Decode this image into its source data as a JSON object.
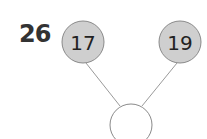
{
  "problem": {
    "number": "26"
  },
  "number_bond": {
    "parts": [
      {
        "label": "17",
        "cx": 83,
        "cy": 42,
        "r": 21
      },
      {
        "label": "19",
        "cx": 180,
        "cy": 42,
        "r": 21
      }
    ],
    "whole": {
      "label": "",
      "cx": 131,
      "cy": 125,
      "r": 21
    },
    "colors": {
      "part_fill": "#cfcfcf",
      "part_stroke": "#8a8a8a",
      "whole_fill": "#ffffff",
      "whole_stroke": "#8a8a8a",
      "line": "#9a9a9a",
      "text": "#222222"
    }
  }
}
